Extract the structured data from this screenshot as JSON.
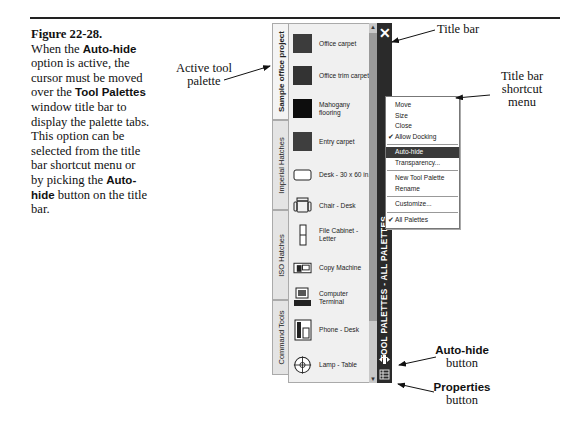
{
  "caption": {
    "figure_label": "Figure 22-28.",
    "text_parts": [
      "When the ",
      "Auto-hide",
      " option is active, the cursor must be moved over the ",
      "Tool Palettes",
      " window title bar to display the palette tabs. This option can be selected from the title bar shortcut menu or by picking the ",
      "Auto-hide",
      " button on the title bar."
    ]
  },
  "callouts": {
    "active_tool_palette": [
      "Active tool",
      "palette"
    ],
    "title_bar": "Title bar",
    "title_bar_shortcut_menu": [
      "Title bar",
      "shortcut",
      "menu"
    ],
    "auto_hide_button": [
      "Auto-hide",
      "button"
    ],
    "properties_button": [
      "Properties",
      "button"
    ]
  },
  "palette": {
    "title": "TOOL PALETTES - ALL PALETTES",
    "close_glyph": "✕",
    "tabs": [
      {
        "label": "Sample office project",
        "active": true
      },
      {
        "label": "Imperial Hatches",
        "active": false
      },
      {
        "label": "ISO Hatches",
        "active": false
      },
      {
        "label": "Command Tools",
        "active": false
      }
    ],
    "items": [
      {
        "label": "Office carpet",
        "icon": "swatch",
        "color": "#3c3c3c"
      },
      {
        "label": "Office trim carpet",
        "icon": "swatch",
        "color": "#333333"
      },
      {
        "label": "Mahogany flooring",
        "icon": "swatch",
        "color": "#0d0d0d"
      },
      {
        "label": "Entry carpet",
        "icon": "swatch",
        "color": "#3e3e3e"
      },
      {
        "label": "Desk - 30 x 60 in.",
        "icon": "desk-icon"
      },
      {
        "label": "Chair - Desk",
        "icon": "chair-icon"
      },
      {
        "label": "File Cabinet - Letter",
        "icon": "file-cabinet-icon"
      },
      {
        "label": "Copy Machine",
        "icon": "copy-machine-icon"
      },
      {
        "label": "Computer Terminal",
        "icon": "computer-icon"
      },
      {
        "label": "Phone - Desk",
        "icon": "phone-icon"
      },
      {
        "label": "Lamp - Table",
        "icon": "lamp-icon"
      }
    ]
  },
  "menu": {
    "items": [
      {
        "label": "Move",
        "checked": false
      },
      {
        "label": "Size",
        "checked": false
      },
      {
        "label": "Close",
        "checked": false
      },
      {
        "label": "Allow Docking",
        "checked": true
      },
      {
        "separator": true
      },
      {
        "label": "Auto-hide",
        "checked": false,
        "highlighted": true
      },
      {
        "label": "Transparency...",
        "checked": false
      },
      {
        "separator": true
      },
      {
        "label": "New Tool Palette",
        "checked": false
      },
      {
        "label": "Rename",
        "checked": false
      },
      {
        "separator": true
      },
      {
        "label": "Customize...",
        "checked": false
      },
      {
        "separator": true
      },
      {
        "label": "All Palettes",
        "checked": true
      }
    ],
    "check_glyph": "✔"
  }
}
